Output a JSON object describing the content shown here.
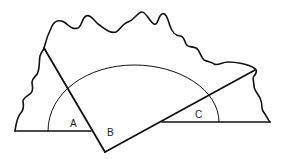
{
  "diagram": {
    "labels": {
      "angle_a": "A",
      "angle_b": "B",
      "angle_c": "C"
    },
    "colors": {
      "line": "#111111",
      "background": "#ffffff"
    }
  }
}
